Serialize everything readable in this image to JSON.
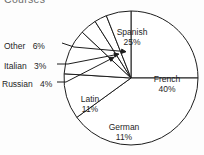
{
  "title": "Courses",
  "chart_data": {
    "type": "pie",
    "title": "Courses",
    "xlabel": "",
    "ylabel": "",
    "units": "percent",
    "total": 100,
    "legend_position": "none",
    "grid": false,
    "categories": [
      "Spanish",
      "French",
      "German",
      "Latin",
      "Russian",
      "Italian",
      "Other"
    ],
    "values": [
      25,
      40,
      11,
      11,
      4,
      3,
      6
    ],
    "slices": [
      {
        "label": "Spanish",
        "value": 25,
        "value_text": "25%",
        "label_placement": "inside"
      },
      {
        "label": "French",
        "value": 40,
        "value_text": "40%",
        "label_placement": "inside"
      },
      {
        "label": "German",
        "value": 11,
        "value_text": "11%",
        "label_placement": "inside"
      },
      {
        "label": "Latin",
        "value": 11,
        "value_text": "11%",
        "label_placement": "inside"
      },
      {
        "label": "Russian",
        "value": 4,
        "value_text": "4%",
        "label_placement": "outside-leader"
      },
      {
        "label": "Italian",
        "value": 3,
        "value_text": "3%",
        "label_placement": "outside-leader"
      },
      {
        "label": "Other",
        "value": 6,
        "value_text": "6%",
        "label_placement": "outside-leader"
      }
    ]
  },
  "labels": {
    "spanish": {
      "name": "Spanish",
      "pct": "25%"
    },
    "french": {
      "name": "French",
      "pct": "40%"
    },
    "german": {
      "name": "German",
      "pct": "11%"
    },
    "latin": {
      "name": "Latin",
      "pct": "11%"
    },
    "russian": {
      "name": "Russian",
      "pct": "4%"
    },
    "italian": {
      "name": "Italian",
      "pct": "3%"
    },
    "other": {
      "name": "Other",
      "pct": "6%"
    }
  },
  "colors": {
    "stroke": "#1d1d1d",
    "fill": "#ffffff",
    "background": "#fdfdfd",
    "title_text": "#6d6d6d",
    "label_text": "#1f1f1f"
  }
}
